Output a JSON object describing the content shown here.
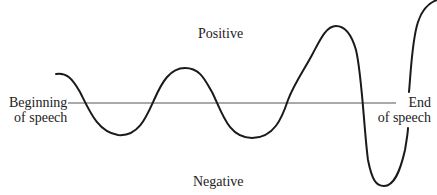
{
  "diagram": {
    "labels": {
      "positive": "Positive",
      "negative": "Negative",
      "beginning_line1": "Beginning",
      "beginning_line2": "of speech",
      "end_line1": "End",
      "end_line2": "of speech"
    },
    "colors": {
      "curve": "#1a1a1a",
      "axis": "#555555",
      "text": "#222222",
      "background": "#ffffff"
    },
    "axis": {
      "x1": 68,
      "x2": 396,
      "y": 103
    },
    "curve_path": "M56,74 C66,72 72,78 80,92 C90,112 98,132 118,135 C138,137 146,118 154,100 C162,82 170,68 185,68 C200,68 205,80 212,92 C222,112 228,138 252,138 C274,138 282,118 288,100 C294,84 304,70 312,55 C320,40 326,26 336,26 C346,26 352,36 356,50 C362,75 364,130 368,160 C372,180 376,186 384,186 C394,186 400,172 405,150 C407,138 408,132 408,128",
    "curve_path_upper": "M409,92 C411,70 412,40 418,22 C422,10 428,3 437,0"
  }
}
